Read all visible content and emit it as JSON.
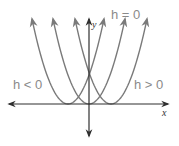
{
  "diagram": {
    "type": "parabola-horizontal-translations",
    "colors": {
      "axis": "#2f2f2f",
      "curve": "#7a7a7a",
      "label": "#8a8a8a"
    },
    "axes": {
      "x_label": "x",
      "y_label": "y",
      "origin_px": [
        89,
        104
      ],
      "x_range_px": [
        9,
        168
      ],
      "y_range_px": [
        19,
        136
      ]
    },
    "curves": [
      {
        "name": "h<0",
        "vertex_px": [
          68,
          104
        ],
        "half_width_px": 36,
        "top_y_px": 19
      },
      {
        "name": "h=0",
        "vertex_px": [
          89,
          104
        ],
        "half_width_px": 36,
        "top_y_px": 19
      },
      {
        "name": "h>0",
        "vertex_px": [
          111,
          104
        ],
        "half_width_px": 36,
        "top_y_px": 19
      }
    ],
    "labels": [
      {
        "id": "h-negative",
        "text": "h < 0",
        "pos_px": [
          13,
          78
        ]
      },
      {
        "id": "h-zero",
        "text": "h = 0",
        "pos_px": [
          111,
          8
        ]
      },
      {
        "id": "h-positive",
        "text": "h > 0",
        "pos_px": [
          134,
          78
        ]
      }
    ]
  }
}
